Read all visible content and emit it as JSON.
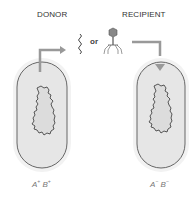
{
  "labels": {
    "donor": "DONOR",
    "recipient": "RECIPIENT",
    "or": "or"
  },
  "donor_cell": {
    "genotype_a": "A",
    "genotype_a_sup": "+",
    "genotype_b": "B",
    "genotype_b_sup": "+"
  },
  "recipient_cell": {
    "genotype_a": "A",
    "genotype_a_sup": "−",
    "genotype_b": "B",
    "genotype_b_sup": "−"
  },
  "colors": {
    "cell_fill": "#e6e6e6",
    "cell_halo": "#f0f0f0",
    "cell_outline": "#666666",
    "arrow": "#999999",
    "chromosome_fill": "#d9d9d9",
    "chromosome_outline": "#333333"
  }
}
